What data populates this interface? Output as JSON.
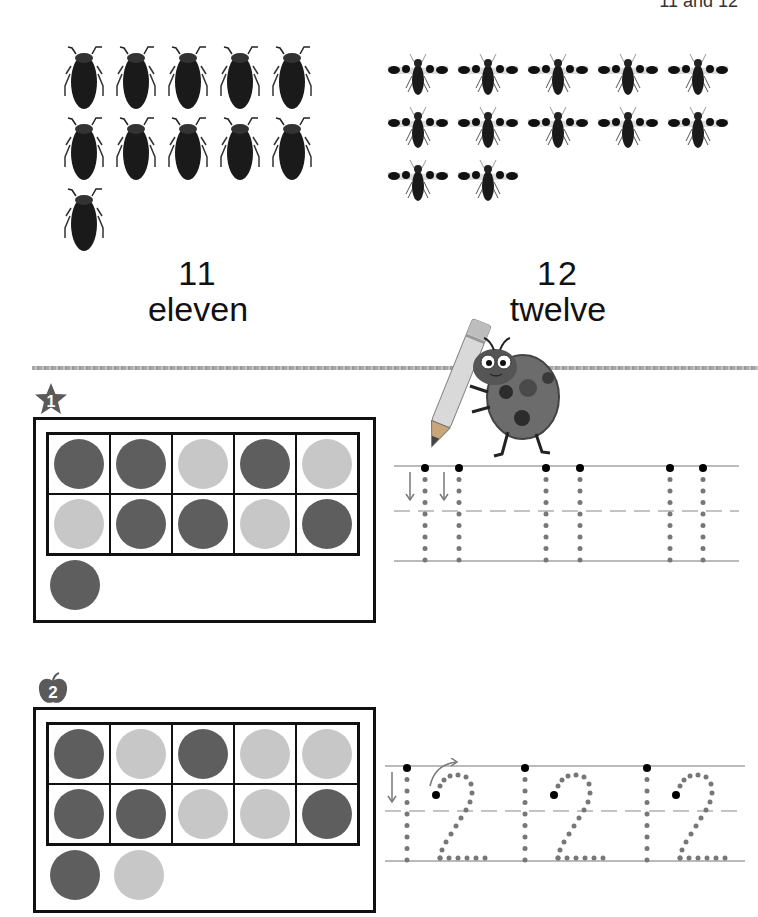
{
  "header": {
    "title": "11 and 12"
  },
  "counting_pictures": {
    "beetles": {
      "count": 11,
      "icon": "beetle-icon"
    },
    "flies": {
      "count": 12,
      "icon": "winged-beetle-icon"
    }
  },
  "numbers": [
    {
      "digit": "11",
      "word": "eleven"
    },
    {
      "digit": "12",
      "word": "twelve"
    }
  ],
  "exercises": [
    {
      "badge": "1",
      "badge_shape": "star",
      "ten_frame": [
        "dark",
        "dark",
        "light",
        "dark",
        "light",
        "light",
        "dark",
        "dark",
        "light",
        "dark"
      ],
      "extra": [
        "dark"
      ],
      "trace_number": "11",
      "trace_repeats": 3
    },
    {
      "badge": "2",
      "badge_shape": "apple",
      "ten_frame": [
        "dark",
        "light",
        "dark",
        "light",
        "light",
        "dark",
        "dark",
        "light",
        "light",
        "dark"
      ],
      "extra": [
        "dark",
        "light"
      ],
      "trace_number": "12",
      "trace_repeats": 3
    }
  ],
  "colors": {
    "dark_counter": "#5e5e5e",
    "light_counter": "#c7c7c7",
    "badge": "#5a5a5a",
    "trace_dot": "#777777",
    "start_dot": "#000000"
  }
}
